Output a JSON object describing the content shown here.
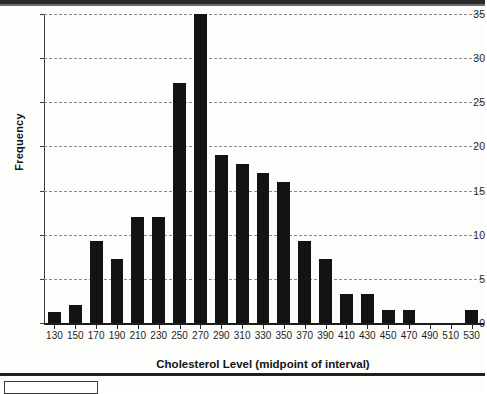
{
  "chart_data": {
    "type": "bar",
    "title": "",
    "xlabel": "Cholesterol Level (midpoint of interval)",
    "ylabel": "Frequency",
    "categories": [
      130,
      150,
      170,
      190,
      210,
      230,
      250,
      270,
      290,
      310,
      330,
      350,
      370,
      390,
      410,
      430,
      450,
      470,
      490,
      510,
      530
    ],
    "values": [
      1.2,
      2,
      9.3,
      7.2,
      12,
      12,
      27.2,
      35,
      19,
      18,
      17,
      16,
      9.3,
      7.2,
      3.3,
      3.3,
      1.5,
      1.5,
      0,
      0,
      1.5
    ],
    "xtick_labels": [
      "130",
      "150",
      "170",
      "190",
      "210",
      "230",
      "250",
      "270",
      "290",
      "310",
      "330",
      "350",
      "370",
      "390",
      "410",
      "430",
      "450",
      "470",
      "490",
      "510",
      "530"
    ],
    "ytick_labels": [
      "0",
      "5",
      "10",
      "15",
      "20",
      "25",
      "30",
      "35"
    ],
    "yticks": [
      0,
      5,
      10,
      15,
      20,
      25,
      30,
      35
    ],
    "ylim": [
      0,
      35
    ],
    "grid": "horizontal-dashed",
    "legend": "none",
    "bar_color": "#131313",
    "grid_color": "#8b8b8b",
    "axis_color": "#1c1c1c"
  }
}
